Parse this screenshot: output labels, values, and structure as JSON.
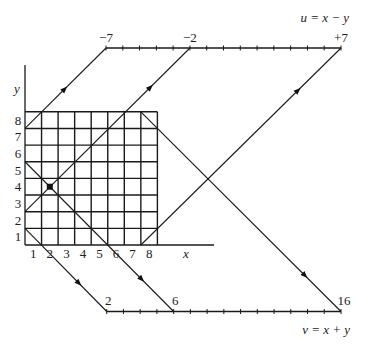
{
  "figure": {
    "xy_plane": {
      "x_axis": {
        "label": "x",
        "ticks": [
          "1",
          "2",
          "3",
          "4",
          "5",
          "6",
          "7",
          "8"
        ]
      },
      "y_axis": {
        "label": "y",
        "ticks": [
          "1",
          "2",
          "3",
          "4",
          "5",
          "6",
          "7",
          "8"
        ]
      },
      "grid_size": 8,
      "highlighted_point": {
        "x": 2,
        "y": 4
      }
    },
    "u_axis": {
      "label": "u = x − y",
      "min": -7,
      "max": 7,
      "tick_count": 15,
      "tick_labels": [
        {
          "value": -7,
          "text": "−7"
        },
        {
          "value": -2,
          "text": "−2"
        },
        {
          "value": 7,
          "text": "+7"
        }
      ]
    },
    "v_axis": {
      "label": "v = x + y",
      "min": 2,
      "max": 16,
      "tick_count": 15,
      "tick_labels": [
        {
          "value": 2,
          "text": "2"
        },
        {
          "value": 6,
          "text": "6"
        },
        {
          "value": 16,
          "text": "16"
        }
      ]
    },
    "u_lines": [
      -7,
      -2,
      7
    ],
    "v_lines": [
      2,
      6,
      16
    ],
    "colors": {
      "ink": "#1a1a1a",
      "background": "#ffffff"
    }
  }
}
